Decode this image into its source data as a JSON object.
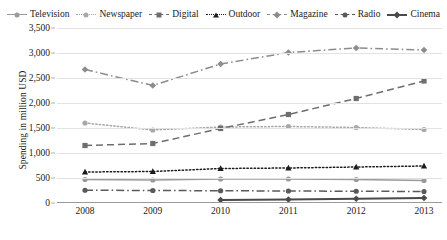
{
  "chart_data": {
    "type": "line",
    "title": "",
    "xlabel": "",
    "ylabel": "Spending in million USD",
    "categories": [
      "2008",
      "2009",
      "2010",
      "2011",
      "2012",
      "2013"
    ],
    "x": [
      2008,
      2009,
      2010,
      2011,
      2012,
      2013
    ],
    "ylim": [
      0,
      3500
    ],
    "ytick_labels": [
      "0",
      "500",
      "1,000",
      "1,500",
      "2,000",
      "2,500",
      "3,000",
      "3,500"
    ],
    "ytick_values": [
      0,
      500,
      1000,
      1500,
      2000,
      2500,
      3000,
      3500
    ],
    "grid": true,
    "legend_position": "top",
    "series": [
      {
        "name": "Television",
        "color": "#9a9a9a",
        "line_style": "solid",
        "marker": "circle",
        "values": [
          470,
          460,
          480,
          480,
          470,
          450
        ]
      },
      {
        "name": "Newspaper",
        "color": "#a8a8a8",
        "line_style": "dotted",
        "marker": "circle",
        "values": [
          1600,
          1460,
          1520,
          1530,
          1510,
          1470
        ]
      },
      {
        "name": "Digital",
        "color": "#6e6e6e",
        "line_style": "dashed",
        "marker": "square",
        "values": [
          1150,
          1190,
          1490,
          1770,
          2090,
          2440
        ]
      },
      {
        "name": "Outdoor",
        "color": "#1c1c1c",
        "line_style": "dotted",
        "marker": "triangle",
        "values": [
          620,
          630,
          690,
          700,
          720,
          740
        ]
      },
      {
        "name": "Magazine",
        "color": "#8c8c8c",
        "line_style": "dashdot",
        "marker": "diamond",
        "values": [
          2670,
          2350,
          2780,
          3010,
          3100,
          3060
        ]
      },
      {
        "name": "Radio",
        "color": "#5a5a5a",
        "line_style": "dashdot",
        "marker": "circle",
        "values": [
          255,
          250,
          245,
          240,
          235,
          230
        ]
      },
      {
        "name": "Cinema",
        "color": "#4a4a4a",
        "line_style": "solid",
        "marker": "diamond",
        "values": [
          null,
          null,
          60,
          70,
          85,
          100
        ]
      }
    ]
  }
}
